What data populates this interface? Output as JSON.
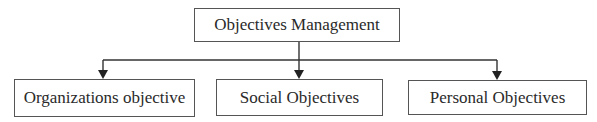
{
  "diagram": {
    "type": "hierarchy",
    "root": {
      "label": "Objectives Management"
    },
    "children": [
      {
        "label": "Organizations objective"
      },
      {
        "label": "Social Objectives"
      },
      {
        "label": "Personal Objectives"
      }
    ],
    "edges": [
      {
        "from": "Objectives Management",
        "to": "Organizations objective"
      },
      {
        "from": "Objectives Management",
        "to": "Social Objectives"
      },
      {
        "from": "Objectives Management",
        "to": "Personal Objectives"
      }
    ],
    "colors": {
      "line": "#333333",
      "box_border": "#555555",
      "text": "#2a2a2a",
      "background": "#ffffff"
    }
  }
}
